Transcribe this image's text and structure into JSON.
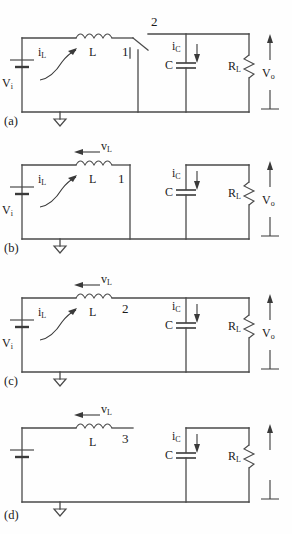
{
  "figure": {
    "background_color": "#fefefe",
    "line_color": "#4a4a4a",
    "text_color": "#1a1a1a",
    "panel_count": 4
  },
  "panels": [
    {
      "caption": "(a)",
      "source_label": "V",
      "source_sub": "i",
      "inductor_label": "L",
      "inductor_current_label": "i",
      "inductor_current_sub": "L",
      "inductor_voltage_label": "",
      "inductor_voltage_sub": "",
      "switch_position_upper": "2",
      "switch_position_lower": "1",
      "cap_label": "C",
      "cap_current_label": "i",
      "cap_current_sub": "C",
      "res_label": "R",
      "res_sub": "L",
      "output_label": "V",
      "output_sub": "o"
    },
    {
      "caption": "(b)",
      "source_label": "V",
      "source_sub": "i",
      "inductor_label": "L",
      "inductor_current_label": "i",
      "inductor_current_sub": "L",
      "inductor_voltage_label": "v",
      "inductor_voltage_sub": "L",
      "switch_position_upper": "",
      "switch_position_lower": "1",
      "cap_label": "C",
      "cap_current_label": "i",
      "cap_current_sub": "C",
      "res_label": "R",
      "res_sub": "L",
      "output_label": "V",
      "output_sub": "o"
    },
    {
      "caption": "(c)",
      "source_label": "V",
      "source_sub": "i",
      "inductor_label": "L",
      "inductor_current_label": "i",
      "inductor_current_sub": "L",
      "inductor_voltage_label": "v",
      "inductor_voltage_sub": "L",
      "switch_position_upper": "2",
      "switch_position_lower": "",
      "cap_label": "C",
      "cap_current_label": "i",
      "cap_current_sub": "C",
      "res_label": "R",
      "res_sub": "L",
      "output_label": "V",
      "output_sub": "o"
    },
    {
      "caption": "(d)",
      "source_label": "",
      "source_sub": "",
      "inductor_label": "L",
      "inductor_current_label": "",
      "inductor_current_sub": "",
      "inductor_voltage_label": "v",
      "inductor_voltage_sub": "L",
      "switch_position_upper": "3",
      "switch_position_lower": "",
      "cap_label": "C",
      "cap_current_label": "i",
      "cap_current_sub": "C",
      "res_label": "R",
      "res_sub": "L",
      "output_label": "",
      "output_sub": ""
    }
  ]
}
